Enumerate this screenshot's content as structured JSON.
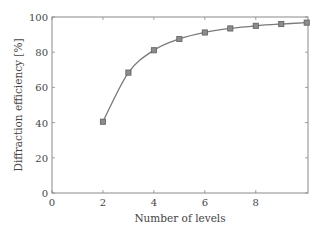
{
  "chart_data": {
    "type": "line",
    "title": "",
    "xlabel": "Number of levels",
    "ylabel": "Diffraction efficiency [%]",
    "x": [
      2,
      3,
      4,
      5,
      6,
      7,
      8,
      9,
      10
    ],
    "series": [
      {
        "name": "Diffraction efficiency",
        "values": [
          40.5,
          68.4,
          81.1,
          87.5,
          91.2,
          93.5,
          95.0,
          96.0,
          96.8
        ],
        "marker": "square",
        "color": "#7a7a7a"
      }
    ],
    "xlim": [
      0,
      10.05
    ],
    "ylim": [
      0,
      100
    ],
    "xticks": [
      0,
      2,
      4,
      6,
      8
    ],
    "yticks": [
      0,
      20,
      40,
      60,
      80,
      100
    ],
    "grid": false,
    "legend": null
  }
}
